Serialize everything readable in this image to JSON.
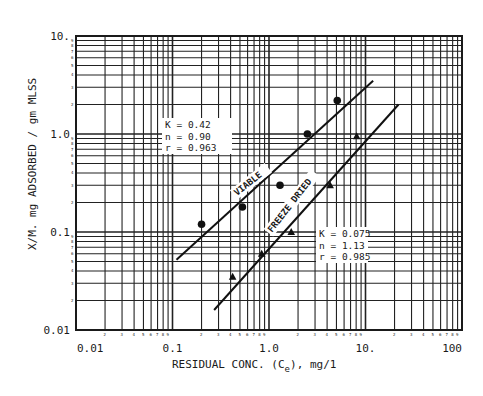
{
  "chart_data": {
    "type": "scatter",
    "title": "",
    "xlabel": "RESIDUAL CONC. (Ce), mg/1",
    "xlabel_parts": {
      "main": "RESIDUAL CONC. (C",
      "sub": "e",
      "tail": "), mg/1"
    },
    "ylabel": "X/M. mg ADSORBED / gm MLSS",
    "xscale": "log",
    "yscale": "log",
    "xlim": [
      0.01,
      100
    ],
    "ylim": [
      0.01,
      10
    ],
    "x_ticks": [
      "0.01",
      "0.1",
      "1.0",
      "10.",
      "100"
    ],
    "y_ticks": [
      "0.01",
      "0.1",
      "1.0",
      "10."
    ],
    "grid": true,
    "series": [
      {
        "name": "VIABLE",
        "marker": "circle",
        "x": [
          0.2,
          0.53,
          1.3,
          2.5,
          5.1
        ],
        "y": [
          0.12,
          0.18,
          0.3,
          1.0,
          2.2
        ],
        "fit_line": {
          "x": [
            0.11,
            12.0
          ],
          "y": [
            0.052,
            3.5
          ]
        },
        "annotation": [
          "K = 0.42",
          "n = 0.90",
          "r = 0.963"
        ]
      },
      {
        "name": "FREEZE DRIED",
        "marker": "triangle",
        "x": [
          0.42,
          0.84,
          1.7,
          4.3,
          8.1
        ],
        "y": [
          0.035,
          0.06,
          0.1,
          0.3,
          0.95
        ],
        "fit_line": {
          "x": [
            0.27,
            22.0
          ],
          "y": [
            0.016,
            2.0
          ]
        },
        "annotation": [
          "K = 0.075",
          "n = 1.13",
          "r = 0.985"
        ]
      }
    ]
  }
}
